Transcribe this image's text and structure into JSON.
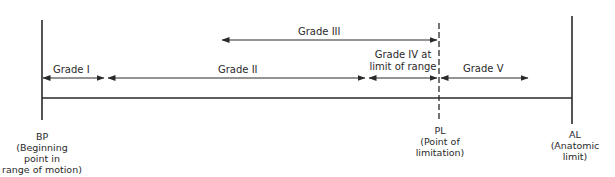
{
  "diagram": {
    "type": "range-of-motion-grades",
    "colors": {
      "line": "#2a2a2a",
      "background": "#ffffff"
    },
    "grades": [
      {
        "id": "grade-1",
        "label": "Grade I"
      },
      {
        "id": "grade-2",
        "label": "Grade II"
      },
      {
        "id": "grade-3",
        "label": "Grade III"
      },
      {
        "id": "grade-4",
        "label_line1": "Grade IV at",
        "label_line2": "limit of range"
      },
      {
        "id": "grade-5",
        "label": "Grade V"
      }
    ],
    "points": {
      "bp": {
        "abbr": "BP",
        "line1": "(Beginning",
        "line2": "point in",
        "line3": "range of motion)"
      },
      "pl": {
        "abbr": "PL",
        "line1": "(Point of",
        "line2": "limitation)"
      },
      "al": {
        "abbr": "AL",
        "line1": "(Anatomic",
        "line2": "limit)"
      }
    }
  }
}
